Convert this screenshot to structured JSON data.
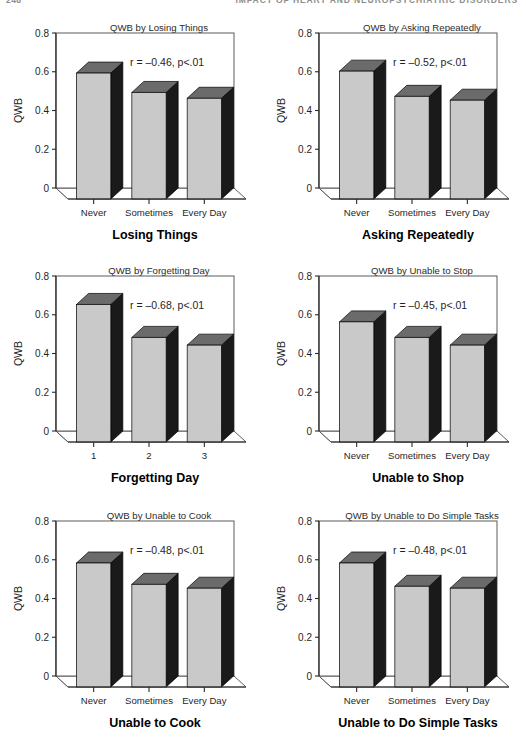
{
  "running_head": {
    "folio": "248",
    "title": "IMPACT OF HEART AND NEUROPSYCHIATRIC DISORDERS"
  },
  "style": {
    "bar_front": "#c9c9c9",
    "bar_side": "#1a1a1a",
    "bar_top": "#6b6b6b",
    "axis": "#2b2b2b",
    "frame": "#4a4a4a",
    "background": "#ffffff"
  },
  "axis": {
    "y_label": "QWB",
    "y_ticks": [
      "0",
      "0.2",
      "0.4",
      "0.6",
      "0.8"
    ],
    "y_tick_values": [
      0,
      0.2,
      0.4,
      0.6,
      0.8
    ],
    "y_min": 0,
    "y_max": 0.8
  },
  "chart_data": [
    {
      "id": "losing-things",
      "type": "bar",
      "title": "QWB by Losing Things",
      "xlabel": "Losing Things",
      "ylabel": "QWB",
      "ylim": [
        0,
        0.8
      ],
      "grid": false,
      "categories": [
        "Never",
        "Sometimes",
        "Every Day"
      ],
      "values": [
        0.65,
        0.55,
        0.52
      ],
      "annotation": "r = –0.46, p<.01",
      "correlation": -0.46,
      "p_value": "p<.01"
    },
    {
      "id": "asking-repeatedly",
      "type": "bar",
      "title": "QWB by Asking Repeatedly",
      "xlabel": "Asking Repeatedly",
      "ylabel": "QWB",
      "ylim": [
        0,
        0.8
      ],
      "grid": false,
      "categories": [
        "Never",
        "Sometimes",
        "Every Day"
      ],
      "values": [
        0.66,
        0.53,
        0.51
      ],
      "annotation": "r = –0.52, p<.01",
      "correlation": -0.52,
      "p_value": "p<.01"
    },
    {
      "id": "forgetting-day",
      "type": "bar",
      "title": "QWB by Forgetting Day",
      "xlabel": "Forgetting Day",
      "ylabel": "QWB",
      "ylim": [
        0,
        0.8
      ],
      "grid": false,
      "categories": [
        "1",
        "2",
        "3"
      ],
      "values": [
        0.71,
        0.54,
        0.5
      ],
      "annotation": "r = –0.68, p<.01",
      "correlation": -0.68,
      "p_value": "p<.01"
    },
    {
      "id": "unable-to-stop",
      "type": "bar",
      "title": "QWB by Unable to Stop",
      "xlabel": "Unable to Shop",
      "ylabel": "QWB",
      "ylim": [
        0,
        0.8
      ],
      "grid": false,
      "categories": [
        "Never",
        "Sometimes",
        "Every Day"
      ],
      "values": [
        0.62,
        0.54,
        0.5
      ],
      "annotation": "r = –0.45, p<.01",
      "correlation": -0.45,
      "p_value": "p<.01"
    },
    {
      "id": "unable-to-cook",
      "type": "bar",
      "title": "QWB by Unable to Cook",
      "xlabel": "Unable to Cook",
      "ylabel": "QWB",
      "ylim": [
        0,
        0.8
      ],
      "grid": false,
      "categories": [
        "Never",
        "Sometimes",
        "Every Day"
      ],
      "values": [
        0.64,
        0.53,
        0.51
      ],
      "annotation": "r = –0.48, p<.01",
      "correlation": -0.48,
      "p_value": "p<.01"
    },
    {
      "id": "unable-to-do-simple-tasks",
      "type": "bar",
      "title": "QWB by Unable to Do Simple Tasks",
      "xlabel": "Unable to Do Simple Tasks",
      "ylabel": "QWB",
      "ylim": [
        0,
        0.8
      ],
      "grid": false,
      "categories": [
        "Never",
        "Sometimes",
        "Every Day"
      ],
      "values": [
        0.64,
        0.52,
        0.51
      ],
      "annotation": "r = –0.48, p<.01",
      "correlation": -0.48,
      "p_value": "p<.01"
    }
  ]
}
